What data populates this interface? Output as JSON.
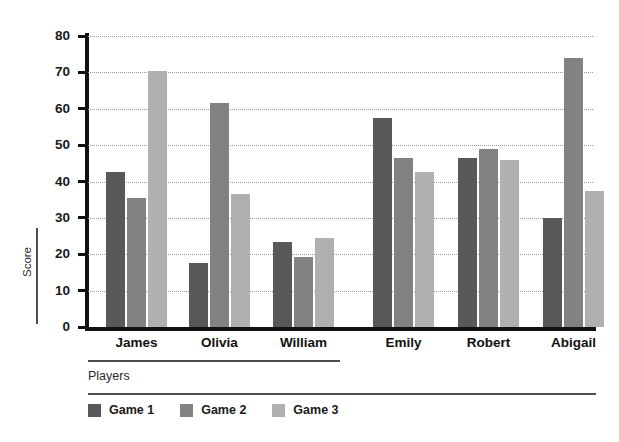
{
  "chart_data": {
    "type": "bar",
    "title": "",
    "subtitle": "",
    "xlabel": "Players",
    "ylabel": "Score",
    "categories": [
      "James",
      "Olivia",
      "William",
      "Emily",
      "Robert",
      "Abigail"
    ],
    "series": [
      {
        "name": "Game 1",
        "color": "#58585a",
        "values": [
          42.5,
          17.5,
          23.5,
          57.5,
          46.5,
          30.0
        ]
      },
      {
        "name": "Game 2",
        "color": "#828284",
        "values": [
          35.5,
          61.5,
          19.3,
          46.5,
          49.0,
          74.0
        ]
      },
      {
        "name": "Game 3",
        "color": "#b0b0b2",
        "values": [
          70.5,
          36.5,
          24.5,
          42.5,
          46.0,
          37.5
        ]
      }
    ],
    "ylim": [
      0,
      80
    ],
    "yticks": [
      0,
      10,
      20,
      30,
      40,
      50,
      60,
      70,
      80
    ],
    "ytick_labels": [
      "0",
      "10",
      "20",
      "30",
      "40",
      "50",
      "60",
      "70",
      "80"
    ],
    "grid": "horizontal-dotted",
    "legend_position": "bottom-left",
    "axis_color": "#111111",
    "gridline_color": "#9a9a9a",
    "background": "#ffffff"
  }
}
